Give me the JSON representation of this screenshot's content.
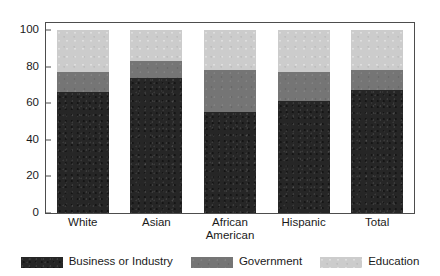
{
  "chart_data": {
    "type": "bar",
    "subtype": "stacked-bar",
    "title": "",
    "xlabel": "",
    "ylabel": "",
    "ylim": [
      0,
      100
    ],
    "yticks": [
      0,
      20,
      40,
      60,
      80,
      100
    ],
    "grid": false,
    "legend_position": "bottom",
    "categories": [
      "White",
      "Asian",
      "African American",
      "Hispanic",
      "Total"
    ],
    "category_label_lines": [
      [
        "White"
      ],
      [
        "Asian"
      ],
      [
        "African",
        "American"
      ],
      [
        "Hispanic"
      ],
      [
        "Total"
      ]
    ],
    "series": [
      {
        "name": "Business or Industry",
        "color": "#262626",
        "values": [
          66,
          74,
          55,
          61,
          67
        ]
      },
      {
        "name": "Government",
        "color": "#757575",
        "values": [
          11,
          9,
          23,
          16,
          11
        ]
      },
      {
        "name": "Education",
        "color": "#cccccc",
        "values": [
          23,
          17,
          22,
          23,
          22
        ]
      }
    ],
    "stack_tops": {
      "business": [
        66,
        74,
        55,
        61,
        67
      ],
      "government": [
        77,
        83,
        78,
        77,
        78
      ],
      "education": [
        100,
        100,
        100,
        100,
        100
      ]
    },
    "axis_color": "#4d4d4d"
  },
  "legend": {
    "items": [
      {
        "label": "Business or Industry",
        "color": "#262626",
        "swatch": "legend-swatch-business"
      },
      {
        "label": "Government",
        "color": "#757575",
        "swatch": "legend-swatch-government"
      },
      {
        "label": "Education",
        "color": "#cccccc",
        "swatch": "legend-swatch-education"
      }
    ]
  }
}
